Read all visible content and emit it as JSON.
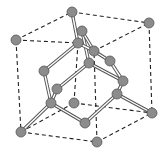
{
  "diagram": {
    "colors": {
      "atom_fill": "#8c8c8c",
      "atom_stroke": "#555555",
      "bond": "#555555",
      "bond_inner": "#ffffff",
      "dash": "#222222"
    },
    "atom_radius": 5,
    "atoms": [
      {
        "id": "a0",
        "x": 72,
        "y": 12
      },
      {
        "id": "a1",
        "x": 149,
        "y": 23
      },
      {
        "id": "a2",
        "x": 16,
        "y": 40
      },
      {
        "id": "a3",
        "x": 82,
        "y": 31
      },
      {
        "id": "a4",
        "x": 78,
        "y": 43
      },
      {
        "id": "a5",
        "x": 94,
        "y": 51
      },
      {
        "id": "a6",
        "x": 110,
        "y": 61
      },
      {
        "id": "a7",
        "x": 44,
        "y": 71
      },
      {
        "id": "a8",
        "x": 89,
        "y": 63
      },
      {
        "id": "a9",
        "x": 123,
        "y": 81
      },
      {
        "id": "a10",
        "x": 57,
        "y": 89
      },
      {
        "id": "a11",
        "x": 117,
        "y": 94
      },
      {
        "id": "a12",
        "x": 51,
        "y": 103
      },
      {
        "id": "a13",
        "x": 74,
        "y": 103
      },
      {
        "id": "a14",
        "x": 152,
        "y": 113
      },
      {
        "id": "a15",
        "x": 85,
        "y": 123
      },
      {
        "id": "a16",
        "x": 21,
        "y": 132
      },
      {
        "id": "a17",
        "x": 97,
        "y": 142
      }
    ],
    "bonds": [
      [
        0,
        4
      ],
      [
        3,
        8
      ],
      [
        4,
        7
      ],
      [
        4,
        5
      ],
      [
        5,
        6
      ],
      [
        3,
        5
      ],
      [
        7,
        12
      ],
      [
        10,
        8
      ],
      [
        8,
        9
      ],
      [
        10,
        12
      ],
      [
        12,
        16
      ],
      [
        12,
        15
      ],
      [
        11,
        15
      ],
      [
        11,
        14
      ],
      [
        11,
        9
      ],
      [
        6,
        9
      ]
    ],
    "cube_edges": [
      [
        2,
        0
      ],
      [
        0,
        1
      ],
      [
        2,
        4
      ],
      [
        5,
        1
      ],
      [
        2,
        16
      ],
      [
        1,
        14
      ],
      [
        16,
        17
      ],
      [
        17,
        14
      ],
      [
        16,
        13
      ],
      [
        13,
        14
      ],
      [
        13,
        4
      ],
      [
        17,
        5
      ]
    ]
  }
}
